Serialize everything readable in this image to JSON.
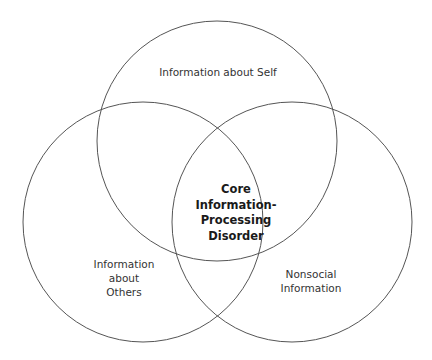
{
  "diagram": {
    "type": "venn",
    "circles": [
      {
        "id": "self",
        "label": "Information about Self",
        "cx": 217,
        "cy": 141,
        "r": 120
      },
      {
        "id": "others",
        "label_lines": [
          "Information",
          "about",
          "Others"
        ],
        "cx": 143,
        "cy": 222,
        "r": 120
      },
      {
        "id": "nonsocial",
        "label_lines": [
          "Nonsocial",
          "Information"
        ],
        "cx": 292,
        "cy": 222,
        "r": 120
      }
    ],
    "center": {
      "label_lines": [
        "Core",
        "Information-",
        "Processing",
        "Disorder"
      ]
    },
    "stroke_color": "#555555"
  }
}
